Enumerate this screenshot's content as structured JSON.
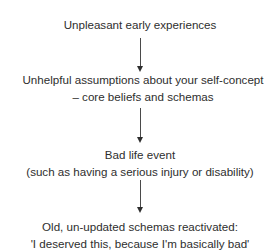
{
  "diagram": {
    "type": "vertical-flowchart",
    "nodes": [
      {
        "id": "n1",
        "lines": [
          "Unpleasant early experiences"
        ]
      },
      {
        "id": "n2",
        "lines": [
          "Unhelpful assumptions about your self-concept",
          "– core beliefs and schemas"
        ]
      },
      {
        "id": "n3",
        "lines": [
          "Bad life event",
          "(such as having a serious injury or disability)"
        ]
      },
      {
        "id": "n4",
        "lines": [
          "Old, un-updated schemas reactivated:",
          "'I deserved this, because I'm basically bad'"
        ]
      }
    ],
    "edges": [
      {
        "from": "n1",
        "to": "n2",
        "icon": "arrow-down-icon"
      },
      {
        "from": "n2",
        "to": "n3",
        "icon": "arrow-down-icon"
      },
      {
        "from": "n3",
        "to": "n4",
        "icon": "arrow-down-icon"
      }
    ],
    "colors": {
      "text": "#2e2e2e",
      "arrow": "#4a4a4a",
      "background": "#ffffff"
    }
  }
}
